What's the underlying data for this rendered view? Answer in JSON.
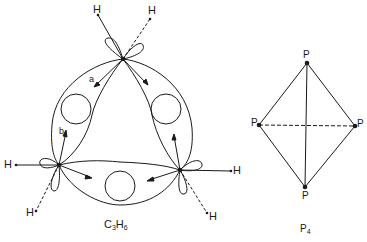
{
  "figure": {
    "left_molecule": {
      "label_main": "C",
      "label_sub1": "3",
      "label_mid": "H",
      "label_sub2": "6",
      "atom_labels": {
        "h_top_left": "H",
        "h_top_right": "H",
        "h_left": "H",
        "h_left_bottom": "H",
        "h_right": "H",
        "h_right_bottom": "H"
      },
      "vector_labels": {
        "a": "a",
        "b": "b"
      }
    },
    "right_molecule": {
      "label_main": "P",
      "label_sub": "4",
      "atom_labels": {
        "top": "P",
        "left": "P",
        "right": "P",
        "bottom": "P"
      }
    },
    "colors": {
      "ink": "#1a1a1a",
      "background": "#ffffff"
    }
  }
}
